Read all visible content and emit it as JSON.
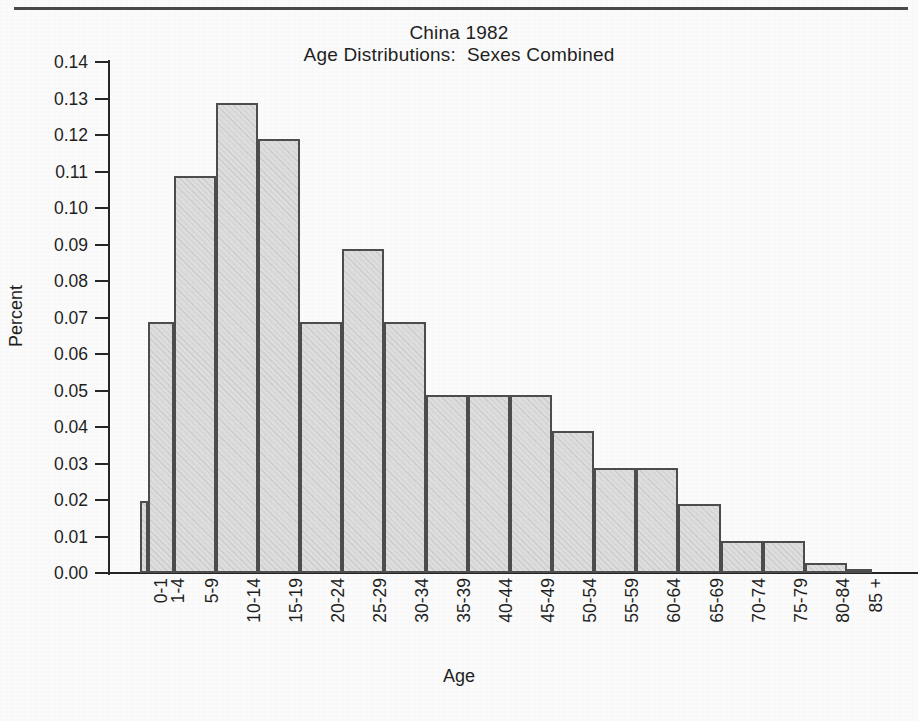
{
  "figure": {
    "title_line1": "China 1982",
    "title_line2": "Age Distributions:  Sexes Combined",
    "xlabel": "Age",
    "ylabel": "Percent"
  },
  "colors": {
    "bar_fill": "#dedede",
    "bar_border": "#4d4d4d",
    "axis": "#262626",
    "text": "#1f1f1f",
    "background": "#fbfbfb"
  },
  "chart_data": {
    "type": "bar",
    "subtitle": "Age Distributions:  Sexes Combined",
    "xlabel": "Age",
    "ylabel": "Percent",
    "ylim": [
      0.0,
      0.14
    ],
    "ytick_labels": [
      "0.14",
      "0.13",
      "0.12",
      "0.11",
      "0.10",
      "0.09",
      "0.08",
      "0.07",
      "0.06",
      "0.05",
      "0.04",
      "0.03",
      "0.02",
      "0.01",
      "0.00"
    ],
    "ytick_values": [
      0.14,
      0.13,
      0.12,
      0.11,
      0.1,
      0.09,
      0.08,
      0.07,
      0.06,
      0.05,
      0.04,
      0.03,
      0.02,
      0.01,
      0.0
    ],
    "grid": false,
    "legend": false,
    "categories": [
      "0-1",
      "1-4",
      "5-9",
      "10-14",
      "15-19",
      "20-24",
      "25-29",
      "30-34",
      "35-39",
      "40-44",
      "45-49",
      "50-54",
      "55-59",
      "60-64",
      "65-69",
      "70-74",
      "75-79",
      "80-84",
      "85 +"
    ],
    "values": [
      0.0198,
      0.0688,
      0.1088,
      0.1288,
      0.1188,
      0.0688,
      0.0888,
      0.0688,
      0.0488,
      0.0488,
      0.0488,
      0.0388,
      0.0288,
      0.0288,
      0.0188,
      0.0088,
      0.0088,
      0.0028,
      0.0006
    ],
    "bar_widths": [
      1,
      3,
      5,
      5,
      5,
      5,
      5,
      5,
      5,
      5,
      5,
      5,
      5,
      5,
      5,
      5,
      5,
      5,
      3
    ]
  }
}
